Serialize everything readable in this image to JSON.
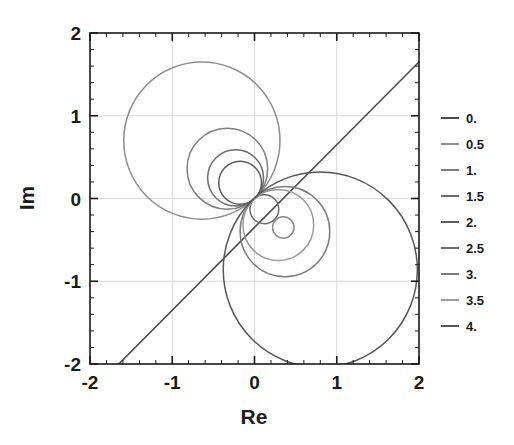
{
  "chart_data": {
    "type": "line",
    "title": "",
    "xlabel": "Re",
    "ylabel": "Im",
    "xlim": [
      -2,
      2
    ],
    "ylim": [
      -2,
      2
    ],
    "xticks": [
      -2,
      -1,
      0,
      1,
      2
    ],
    "yticks": [
      -2,
      -1,
      0,
      1,
      2
    ],
    "xtick_labels": [
      "-2",
      "-1",
      "0",
      "1",
      "2"
    ],
    "ytick_labels": [
      "-2",
      "-1",
      "0",
      "1",
      "2"
    ],
    "grid": true,
    "minor_ticks_per_interval": 5,
    "legend_position": "right",
    "legend_title": "",
    "series": [
      {
        "name": "0.",
        "value": 0,
        "color": "#4a4a4a",
        "shape": "line",
        "line_endpoints": [
          [
            -1.65,
            -2.0
          ],
          [
            2.0,
            1.65
          ]
        ],
        "description": "straight line of slope 1 through origin, offset so it spans from (-1.65,-2) to (2,1.65)"
      },
      {
        "name": "0.5",
        "value": 0.5,
        "color": "#8e8e8e",
        "shape": "circle",
        "center": [
          -0.64,
          0.7
        ],
        "radius": 0.95,
        "description": "largest circle, upper-left lobe, top near Im=1.72"
      },
      {
        "name": "1.",
        "value": 1.0,
        "color": "#7e7e7e",
        "shape": "circle",
        "center": [
          -0.33,
          0.36
        ],
        "radius": 0.49
      },
      {
        "name": "1.5",
        "value": 1.5,
        "color": "#6e6e6e",
        "shape": "circle",
        "center": [
          -0.23,
          0.25
        ],
        "radius": 0.34
      },
      {
        "name": "2.",
        "value": 2.0,
        "color": "#5a5a5a",
        "shape": "circle",
        "center": [
          -0.175,
          0.19
        ],
        "radius": 0.26
      },
      {
        "name": "2.5",
        "value": 2.5,
        "color": "#6a6a6a",
        "shape": "circle",
        "center": [
          0.12,
          -0.13
        ],
        "radius": 0.175
      },
      {
        "name": "3.",
        "value": 3.0,
        "color": "#7a7a7a",
        "shape": "circle",
        "center": [
          0.37,
          -0.4
        ],
        "radius": 0.545
      },
      {
        "name": "3.5",
        "value": 3.5,
        "color": "#9a9a9a",
        "shape": "circle",
        "center": [
          0.29,
          -0.32
        ],
        "radius": 0.43
      },
      {
        "name": "4.",
        "value": 4.0,
        "color": "#565656",
        "shape": "circle",
        "center": [
          0.8,
          -0.86
        ],
        "radius": 1.18
      }
    ],
    "extra_curves": [
      {
        "name": "small-inner-circle",
        "color": "#8a8a8a",
        "shape": "circle",
        "center": [
          0.35,
          -0.35
        ],
        "radius": 0.13
      }
    ]
  },
  "legend": {
    "items": [
      {
        "label": "0.",
        "color": "#4a4a4a"
      },
      {
        "label": "0.5",
        "color": "#8e8e8e"
      },
      {
        "label": "1.",
        "color": "#7e7e7e"
      },
      {
        "label": "1.5",
        "color": "#6e6e6e"
      },
      {
        "label": "2.",
        "color": "#5a5a5a"
      },
      {
        "label": "2.5",
        "color": "#6a6a6a"
      },
      {
        "label": "3.",
        "color": "#7a7a7a"
      },
      {
        "label": "3.5",
        "color": "#9a9a9a"
      },
      {
        "label": "4.",
        "color": "#565656"
      }
    ]
  },
  "axes": {
    "x_title": "Re",
    "y_title": "Im"
  },
  "style": {
    "frame_color": "#1a1a1a",
    "grid_color": "#d8d8d8",
    "background": "#ffffff"
  }
}
